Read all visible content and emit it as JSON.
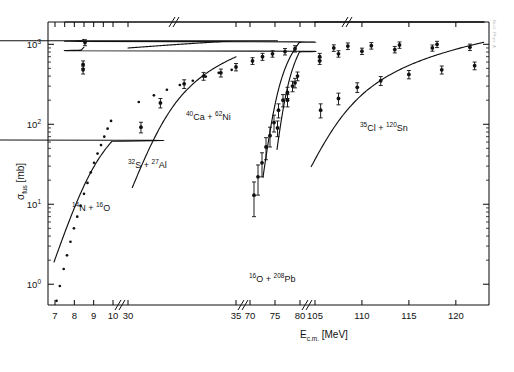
{
  "figure": {
    "margin_note": "Nucl. Phys. A",
    "background": "#ffffff",
    "ink": "#111111"
  },
  "chart_data": {
    "type": "line",
    "title": "",
    "xlabel": "E_c.m. [MeV]",
    "xlabel_parts": {
      "main": "E",
      "sub": "c.m.",
      "unit": "[MeV]"
    },
    "ylabel": "σ_fus [mb]",
    "ylabel_parts": {
      "symbol": "σ",
      "sub": "fus",
      "unit": "[mb]"
    },
    "yscale": "log",
    "ylim": [
      0.55,
      1900
    ],
    "ytick_values": [
      1,
      10,
      100,
      1000
    ],
    "ytick_labels": [
      "10⁰",
      "10¹",
      "10²",
      "10³"
    ],
    "ytick_exponents": [
      "0",
      "1",
      "2",
      "3"
    ],
    "grid": false,
    "legend": "inline-annotations",
    "axis_breaks": [
      {
        "after": 10,
        "before": 30
      },
      {
        "after": 35,
        "before": 70
      },
      {
        "after": 80,
        "before": 105
      }
    ],
    "xtick_labels": [
      "7",
      "8",
      "9",
      "10",
      "30",
      "35",
      "70",
      "75",
      "80",
      "105",
      "110",
      "115",
      "120"
    ],
    "xtick_values": [
      7,
      8,
      9,
      10,
      30,
      35,
      70,
      75,
      80,
      105,
      110,
      115,
      120
    ],
    "series": [
      {
        "name": "14N + 16O",
        "label_parts": {
          "a_sup": "14",
          "a_el": "N",
          "op": "+",
          "b_sup": "16",
          "b_el": "O"
        },
        "marker": "filled-circle-small",
        "points": [
          {
            "x": 7.08,
            "y": 0.62
          },
          {
            "x": 7.25,
            "y": 0.95
          },
          {
            "x": 7.45,
            "y": 1.55
          },
          {
            "x": 7.62,
            "y": 2.3
          },
          {
            "x": 7.8,
            "y": 3.4
          },
          {
            "x": 7.98,
            "y": 5.0
          },
          {
            "x": 8.15,
            "y": 7.0
          },
          {
            "x": 8.32,
            "y": 9.6
          },
          {
            "x": 8.5,
            "y": 13.5
          },
          {
            "x": 8.68,
            "y": 18.5
          },
          {
            "x": 8.85,
            "y": 25.0
          },
          {
            "x": 9.02,
            "y": 33.0
          },
          {
            "x": 9.2,
            "y": 43.0
          },
          {
            "x": 9.38,
            "y": 55.0
          },
          {
            "x": 9.55,
            "y": 70.0
          },
          {
            "x": 9.72,
            "y": 88.0
          },
          {
            "x": 9.9,
            "y": 110.0
          },
          {
            "x": 10.05,
            "y": 135.0
          },
          {
            "x": 30.5,
            "y": 190.0
          },
          {
            "x": 31.2,
            "y": 230.0
          },
          {
            "x": 31.8,
            "y": 270.0
          },
          {
            "x": 32.4,
            "y": 310.0
          },
          {
            "x": 33.0,
            "y": 350.0
          },
          {
            "x": 33.6,
            "y": 395.0
          },
          {
            "x": 34.2,
            "y": 440.0
          },
          {
            "x": 34.8,
            "y": 480.0
          },
          {
            "x": 35.2,
            "y": 520.0
          }
        ]
      },
      {
        "name": "32S + 27Al",
        "label_parts": {
          "a_sup": "32",
          "a_el": "S",
          "op": "+",
          "b_sup": "27",
          "b_el": "Al"
        },
        "marker": "filled-circle-errorbar",
        "points": [
          {
            "x": 30.6,
            "y": 92.0,
            "err": 14
          },
          {
            "x": 31.5,
            "y": 185.0,
            "err": 25
          },
          {
            "x": 32.6,
            "y": 320.0,
            "err": 40
          },
          {
            "x": 33.5,
            "y": 400.0,
            "err": 45
          },
          {
            "x": 34.3,
            "y": 440.0,
            "err": 50
          },
          {
            "x": 35.0,
            "y": 520.0,
            "err": 55
          },
          {
            "x": 70.5,
            "y": 620.0,
            "err": 60
          },
          {
            "x": 72.5,
            "y": 700.0,
            "err": 70
          },
          {
            "x": 74.5,
            "y": 760.0,
            "err": 70
          },
          {
            "x": 77.0,
            "y": 810.0,
            "err": 75
          },
          {
            "x": 79.0,
            "y": 880.0,
            "err": 80
          },
          {
            "x": 80.5,
            "y": 1050.0,
            "err": 90
          }
        ]
      },
      {
        "name": "40Ca + 62Ni",
        "label_parts": {
          "a_sup": "40",
          "a_el": "Ca",
          "op": "+",
          "b_sup": "62",
          "b_el": "Ni"
        },
        "marker": "filled-circle-errorbar",
        "points": [
          {
            "x": 70.8,
            "y": 13.0,
            "err": 6
          },
          {
            "x": 71.6,
            "y": 22.0,
            "err": 9
          },
          {
            "x": 72.4,
            "y": 33.0,
            "err": 11
          },
          {
            "x": 73.2,
            "y": 52.0,
            "err": 16
          },
          {
            "x": 74.0,
            "y": 72.0,
            "err": 20
          },
          {
            "x": 74.8,
            "y": 105.0,
            "err": 25
          },
          {
            "x": 75.7,
            "y": 150.0,
            "err": 30
          },
          {
            "x": 76.6,
            "y": 200.0,
            "err": 35
          },
          {
            "x": 77.5,
            "y": 250.0,
            "err": 40
          },
          {
            "x": 78.5,
            "y": 300.0,
            "err": 45
          },
          {
            "x": 79.5,
            "y": 400.0,
            "err": 50
          },
          {
            "x": 80.3,
            "y": 560.0,
            "err": 60
          },
          {
            "x": 105.5,
            "y": 700.0,
            "err": 70
          },
          {
            "x": 107.0,
            "y": 900.0,
            "err": 85
          },
          {
            "x": 108.5,
            "y": 950.0,
            "err": 90
          },
          {
            "x": 111.0,
            "y": 960.0,
            "err": 90
          },
          {
            "x": 114.0,
            "y": 980.0,
            "err": 90
          },
          {
            "x": 118.0,
            "y": 1000.0,
            "err": 90
          }
        ]
      },
      {
        "name": "16O + 208Pb",
        "label_parts": {
          "a_sup": "16",
          "a_el": "O",
          "op": "+",
          "b_sup": "208",
          "b_el": "Pb"
        },
        "marker": "filled-circle-errorbar",
        "points": [
          {
            "x": 75.5,
            "y": 90.0,
            "err": 20
          },
          {
            "x": 77.5,
            "y": 200.0,
            "err": 35
          },
          {
            "x": 79.0,
            "y": 330.0,
            "err": 45
          },
          {
            "x": 80.3,
            "y": 480.0,
            "err": 55
          },
          {
            "x": 105.5,
            "y": 620.0,
            "err": 60
          },
          {
            "x": 107.5,
            "y": 760.0,
            "err": 70
          },
          {
            "x": 110.0,
            "y": 820.0,
            "err": 75
          },
          {
            "x": 113.5,
            "y": 860.0,
            "err": 80
          },
          {
            "x": 117.5,
            "y": 900.0,
            "err": 80
          },
          {
            "x": 121.5,
            "y": 920.0,
            "err": 85
          }
        ]
      },
      {
        "name": "35Cl + 120Sn",
        "label_parts": {
          "a_sup": "35",
          "a_el": "Cl",
          "op": "+",
          "b_sup": "120",
          "b_el": "Sn"
        },
        "marker": "filled-circle-errorbar",
        "points": [
          {
            "x": 105.6,
            "y": 150.0,
            "err": 30
          },
          {
            "x": 107.5,
            "y": 210.0,
            "err": 35
          },
          {
            "x": 109.5,
            "y": 290.0,
            "err": 40
          },
          {
            "x": 112.0,
            "y": 350.0,
            "err": 45
          },
          {
            "x": 115.0,
            "y": 420.0,
            "err": 50
          },
          {
            "x": 118.5,
            "y": 480.0,
            "err": 55
          },
          {
            "x": 122.0,
            "y": 540.0,
            "err": 60
          }
        ]
      }
    ],
    "annotations": [
      {
        "id": "ann-14n-16o",
        "text": "14N + 16O",
        "x_px": 72,
        "y_px": 211
      },
      {
        "id": "ann-32s-27al",
        "text": "32S + 27Al",
        "x_px": 128,
        "y_px": 168
      },
      {
        "id": "ann-40ca-62ni",
        "text": "40Ca + 62Ni",
        "x_px": 186,
        "y_px": 120
      },
      {
        "id": "ann-16o-208pb",
        "text": "16O + 208Pb",
        "x_px": 249,
        "y_px": 282
      },
      {
        "id": "ann-35cl-120sn",
        "text": "35Cl + 120Sn",
        "x_px": 360,
        "y_px": 131
      }
    ]
  }
}
